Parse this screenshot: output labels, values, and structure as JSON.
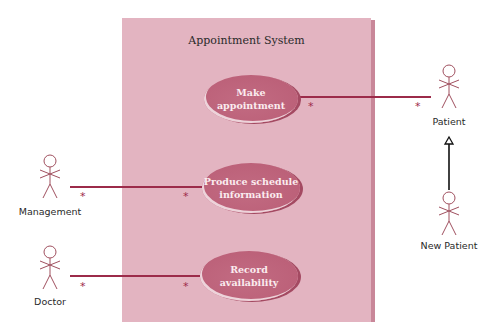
{
  "diagram": {
    "type": "UML use case diagram",
    "system": {
      "title": "Appointment System"
    },
    "use_cases": [
      {
        "id": "make-appointment",
        "lines": [
          "Make",
          "appointment"
        ]
      },
      {
        "id": "produce-schedule",
        "lines": [
          "Produce schedule",
          "information"
        ]
      },
      {
        "id": "record-availability",
        "lines": [
          "Record",
          "availability"
        ]
      }
    ],
    "actors": [
      {
        "id": "patient",
        "label": "Patient"
      },
      {
        "id": "new-patient",
        "label": "New Patient"
      },
      {
        "id": "management",
        "label": "Management"
      },
      {
        "id": "doctor",
        "label": "Doctor"
      }
    ],
    "associations": [
      {
        "actor": "Patient",
        "use_case": "Make appointment",
        "actor_multiplicity": "*",
        "use_case_multiplicity": "*"
      },
      {
        "actor": "Management",
        "use_case": "Produce schedule information",
        "actor_multiplicity": "*",
        "use_case_multiplicity": "*"
      },
      {
        "actor": "Doctor",
        "use_case": "Record availability",
        "actor_multiplicity": "*",
        "use_case_multiplicity": "*"
      }
    ],
    "generalizations": [
      {
        "child": "New Patient",
        "parent": "Patient"
      }
    ],
    "multiplicity_symbol": "*",
    "colors": {
      "system_fill": "#e3b4c1",
      "system_edge": "#c98799",
      "use_case_fill": "#bc6179",
      "use_case_text": "#fbecef",
      "association_line": "#9c2b4a",
      "actor_stroke": "#a0505f",
      "generalization_line": "#111111"
    }
  }
}
